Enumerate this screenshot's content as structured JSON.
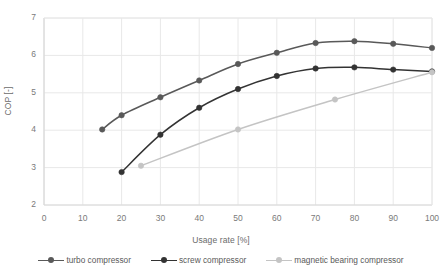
{
  "chart_data": {
    "type": "line",
    "title": "",
    "subtitle": "",
    "xlabel": "Usage rate [%]",
    "ylabel": "COP [-]",
    "xlim": [
      0,
      100
    ],
    "ylim": [
      2,
      7
    ],
    "xticks": [
      0,
      10,
      20,
      30,
      40,
      50,
      60,
      70,
      80,
      90,
      100
    ],
    "yticks": [
      2,
      3,
      4,
      5,
      6,
      7
    ],
    "grid": "horizontal-and-vertical",
    "legend_position": "below-plot",
    "markers": "circle",
    "series": [
      {
        "name": "turbo compressor",
        "color": "#595959",
        "x": [
          15,
          20,
          30,
          40,
          50,
          60,
          70,
          80,
          90,
          100
        ],
        "values": [
          4.02,
          4.4,
          4.88,
          5.33,
          5.77,
          6.07,
          6.33,
          6.38,
          6.31,
          6.2
        ]
      },
      {
        "name": "screw compressor",
        "color": "#333333",
        "x": [
          20,
          30,
          40,
          50,
          60,
          70,
          80,
          90,
          100
        ],
        "values": [
          2.88,
          3.88,
          4.6,
          5.1,
          5.45,
          5.65,
          5.68,
          5.62,
          5.57
        ]
      },
      {
        "name": "magnetic bearing compressor",
        "color": "#c4c4c4",
        "x": [
          25,
          50,
          75,
          100
        ],
        "values": [
          3.05,
          4.02,
          4.82,
          5.55
        ]
      }
    ]
  },
  "legend": {
    "items": [
      {
        "label": "turbo compressor"
      },
      {
        "label": "screw compressor"
      },
      {
        "label": "magnetic bearing compressor"
      }
    ]
  },
  "colors": {
    "turbo": "#595959",
    "screw": "#333333",
    "magnetic": "#c4c4c4",
    "grid": "#e8e8e8",
    "axis": "#d9d9d9",
    "text": "#7a7a7a"
  }
}
